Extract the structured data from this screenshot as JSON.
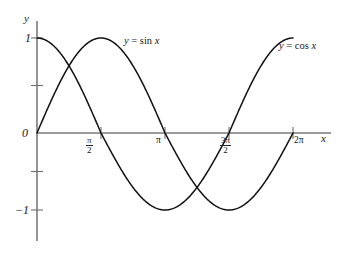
{
  "figure": {
    "background_color": "#ffffff",
    "axis_color": "#6f6f6f",
    "curve_color": "#111111",
    "text_color": "#161616"
  },
  "axes": {
    "y_axis_label": "y",
    "x_axis_label": "x",
    "origin_label": "0",
    "y_ticks": [
      {
        "label": "1",
        "value": 1
      },
      {
        "label": "",
        "value": 0.5
      },
      {
        "label": "",
        "value": -0.5
      },
      {
        "label": "−1",
        "value": -1
      }
    ],
    "x_ticks": [
      {
        "label": "π/2",
        "numerator": "π",
        "denominator": "2",
        "value": 1.5707963
      },
      {
        "label": "π",
        "numerator": "π",
        "denominator": "",
        "value": 3.1415927
      },
      {
        "label": "3π/2",
        "numerator": "3π",
        "denominator": "2",
        "value": 4.712389
      },
      {
        "label": "2π",
        "numerator": "2π",
        "denominator": "",
        "value": 6.2831853
      }
    ]
  },
  "curve_labels": {
    "sine": {
      "lhs": "y",
      "op": "=",
      "fn": "sin",
      "arg": "x",
      "full": "y = sin x"
    },
    "cosine": {
      "lhs": "y",
      "op": "=",
      "fn": "cos",
      "arg": "x",
      "full": "y = cos x"
    }
  },
  "chart_data": {
    "type": "line",
    "title": "",
    "xlabel": "x",
    "ylabel": "y",
    "xlim": [
      0,
      6.2831853
    ],
    "ylim": [
      -1,
      1
    ],
    "grid": false,
    "legend": "inline-curve-labels",
    "xticks": [
      0,
      1.5707963,
      3.1415927,
      4.712389,
      6.2831853
    ],
    "xticklabels": [
      "0",
      "π/2",
      "π",
      "3π/2",
      "2π"
    ],
    "yticks": [
      -1,
      -0.5,
      0,
      0.5,
      1
    ],
    "yticklabels": [
      "−1",
      "",
      "0",
      "",
      "1"
    ],
    "series": [
      {
        "name": "y = sin x",
        "function": "sin",
        "color": "#111111",
        "x": [
          0,
          0.3926991,
          0.7853982,
          1.1780972,
          1.5707963,
          1.9634954,
          2.3561945,
          2.7488936,
          3.1415927,
          3.5342917,
          3.9269908,
          4.3196899,
          4.712389,
          5.1050881,
          5.4977871,
          5.8904862,
          6.2831853
        ],
        "values": [
          0,
          0.38268,
          0.70711,
          0.92388,
          1,
          0.92388,
          0.70711,
          0.38268,
          0,
          -0.38268,
          -0.70711,
          -0.92388,
          -1,
          -0.92388,
          -0.70711,
          -0.38268,
          0
        ]
      },
      {
        "name": "y = cos x",
        "function": "cos",
        "color": "#111111",
        "x": [
          0,
          0.3926991,
          0.7853982,
          1.1780972,
          1.5707963,
          1.9634954,
          2.3561945,
          2.7488936,
          3.1415927,
          3.5342917,
          3.9269908,
          4.3196899,
          4.712389,
          5.1050881,
          5.4977871,
          5.8904862,
          6.2831853
        ],
        "values": [
          1,
          0.92388,
          0.70711,
          0.38268,
          0,
          -0.38268,
          -0.70711,
          -0.92388,
          -1,
          -0.92388,
          -0.70711,
          -0.38268,
          0,
          0.38268,
          0.70711,
          0.92388,
          1
        ]
      }
    ],
    "annotations": [
      {
        "text": "y = sin x",
        "x": 2.0,
        "y": 0.88
      },
      {
        "text": "y = cos x",
        "x": 5.9,
        "y": 0.85
      }
    ]
  }
}
